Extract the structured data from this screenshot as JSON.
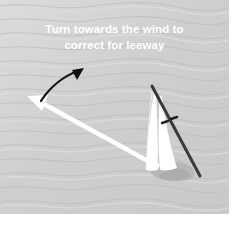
{
  "figure": {
    "title": "Turn towards the wind to correct for leeway",
    "domain_kind": "sailing-leeway-diagram",
    "width": 235,
    "height": 227
  },
  "caption": {
    "line1": "Turn towards the wind to",
    "line2": "correct for leeway",
    "color": "#ffffff"
  },
  "colors": {
    "water": "#cfcfcf",
    "water_wave_light": "#dedede",
    "water_wave_dark": "#c2c2c2",
    "page_background": "#ffffff",
    "hull_line": "#333333",
    "sail_white": "#ffffff",
    "wake_shadow": "#b0b0b0",
    "turn_arrow": "#111111",
    "heading_arrow": "#ffffff"
  },
  "elements": {
    "water_background": {
      "label": "Wavy water surface",
      "wave_count": 15
    },
    "turn_arrow": {
      "label": "Curved turn-to-windward arrow",
      "color": "#111111",
      "direction": "counter-clockwise, pointing up-right",
      "start": [
        42,
        101
      ],
      "end": [
        83,
        70
      ]
    },
    "heading_arrow": {
      "label": "Corrected heading arrow",
      "color": "#ffffff",
      "direction": "pointing up-left",
      "start": [
        158,
        167
      ],
      "end": [
        28,
        96
      ]
    },
    "boat": {
      "label": "Sailboat heeling with mainsail and jib",
      "mast_line_start": [
        152,
        86
      ],
      "mast_line_end": [
        200,
        176
      ],
      "sails": 2,
      "wake": "grey shadow at hull base",
      "telltale_mark": "small dark dash near mast at (167,122)"
    }
  }
}
